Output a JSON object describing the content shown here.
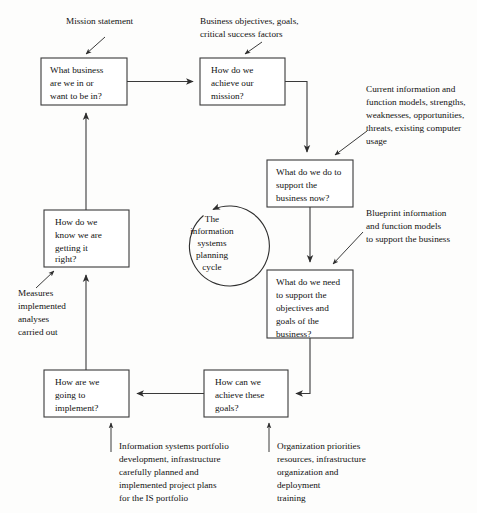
{
  "diagram": {
    "title": "The information systems planning cycle",
    "colors": {
      "background": "#fdfdfc",
      "stroke": "#3a3a3a",
      "text": "#111111",
      "box_fill": "#ffffff"
    },
    "center": {
      "label_lines": [
        "The",
        "information",
        "systems",
        "planning",
        "cycle"
      ]
    },
    "boxes": [
      {
        "id": "what-business",
        "lines": [
          "What business",
          "are we in or",
          "want to be in?"
        ]
      },
      {
        "id": "achieve-mission",
        "lines": [
          "How do we",
          "achieve our",
          "mission?"
        ]
      },
      {
        "id": "support-business-now",
        "lines": [
          "What do we do to",
          "support the",
          "business now?"
        ]
      },
      {
        "id": "what-do-we-need",
        "lines": [
          "What do we need",
          "to support the",
          "objectives and",
          "goals of the",
          "business?"
        ]
      },
      {
        "id": "achieve-these-goals",
        "lines": [
          "How can we",
          "achieve these",
          "goals?"
        ]
      },
      {
        "id": "going-to-implement",
        "lines": [
          "How are we",
          "going to",
          "implement?"
        ]
      }
    ],
    "annotations": [
      {
        "id": "mission-statement",
        "lines": [
          "Mission statement"
        ]
      },
      {
        "id": "business-objectives",
        "lines": [
          "Business objectives, goals,",
          "critical success factors"
        ]
      },
      {
        "id": "current-information",
        "lines": [
          "Current information and",
          "function models, strengths,",
          "weaknesses, opportunities,",
          "threats, existing computer",
          "usage"
        ]
      },
      {
        "id": "blueprint-information",
        "lines": [
          "Blueprint  information",
          "and function models",
          "to support the business"
        ]
      },
      {
        "id": "measures-implemented",
        "lines": [
          "Measures",
          "implemented",
          "analyses",
          "carried out"
        ]
      },
      {
        "id": "is-portfolio",
        "lines": [
          "Information systems portfolio",
          "development, infrastructure",
          "carefully planned and",
          "implemented project plans",
          "for the IS portfolio"
        ]
      },
      {
        "id": "organization-priorities",
        "lines": [
          "Organization priorities",
          "resources, infrastructure",
          "organization and",
          "deployment",
          "training"
        ]
      }
    ]
  }
}
